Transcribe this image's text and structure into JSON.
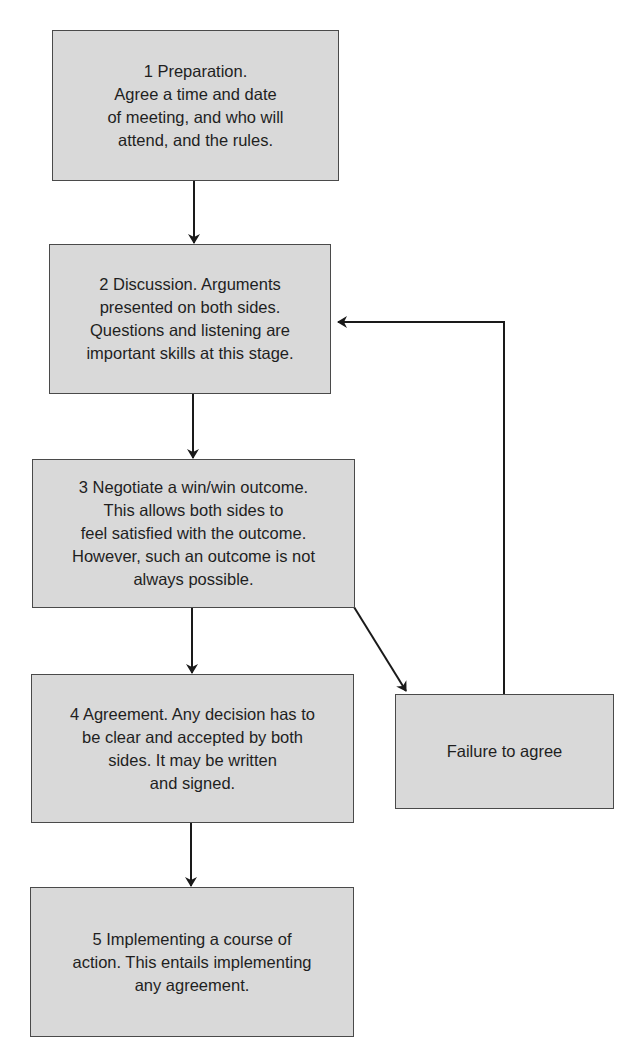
{
  "diagram": {
    "type": "flowchart",
    "nodes": [
      {
        "id": "step1",
        "label": "1 Preparation.\nAgree a time and date\nof meeting, and who will\nattend, and the rules."
      },
      {
        "id": "step2",
        "label": "2 Discussion. Arguments\npresented on both sides.\nQuestions and listening are\nimportant skills at this stage."
      },
      {
        "id": "step3",
        "label": "3 Negotiate a win/win outcome.\nThis allows both sides to\nfeel satisfied with the outcome.\nHowever, such an outcome is not\nalways possible."
      },
      {
        "id": "step4",
        "label": "4 Agreement. Any decision has to\nbe clear and accepted by both\nsides. It may be written\nand signed."
      },
      {
        "id": "failure",
        "label": "Failure to agree"
      },
      {
        "id": "step5",
        "label": "5 Implementing a course of\naction. This entails implementing\nany agreement."
      }
    ],
    "edges": [
      {
        "from": "step1",
        "to": "step2"
      },
      {
        "from": "step2",
        "to": "step3"
      },
      {
        "from": "step3",
        "to": "step4"
      },
      {
        "from": "step3",
        "to": "failure"
      },
      {
        "from": "failure",
        "to": "step2"
      },
      {
        "from": "step4",
        "to": "step5"
      }
    ],
    "colors": {
      "box_fill": "#d9d9d9",
      "box_border": "#4a4a4a",
      "line": "#1a1a1a",
      "text": "#1f1f1f"
    }
  }
}
